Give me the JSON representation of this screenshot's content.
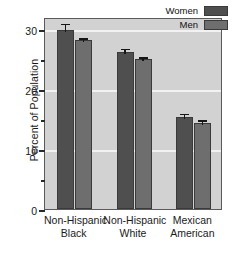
{
  "chart_data": {
    "type": "bar",
    "title": "",
    "xlabel": "",
    "ylabel": "Percent of Population",
    "ylim": [
      0,
      32
    ],
    "yticks": [
      0,
      10,
      20,
      30
    ],
    "yticks_minor": [
      5,
      15,
      25
    ],
    "ytick_labels": [
      "0",
      "10",
      "20",
      "30"
    ],
    "grid": true,
    "grid_axis": "y",
    "legend_position": "top-right",
    "categories": [
      "Non-Hispanic Black",
      "Non-Hispanic White",
      "Mexican American"
    ],
    "category_lines": [
      [
        "Non-Hispanic",
        "Black"
      ],
      [
        "Non-Hispanic",
        "White"
      ],
      [
        "Mexican",
        "American"
      ]
    ],
    "series": [
      {
        "name": "Women",
        "color": "#4f4f4f",
        "values": [
          29.9,
          26.2,
          15.3
        ],
        "errors": [
          1.2,
          0.7,
          0.8
        ]
      },
      {
        "name": "Men",
        "color": "#6e6e6e",
        "values": [
          28.1,
          25.0,
          14.3
        ],
        "errors": [
          0.6,
          0.5,
          0.7
        ]
      }
    ]
  },
  "legend": {
    "items": [
      {
        "label": "Women"
      },
      {
        "label": "Men"
      }
    ]
  },
  "axes": {
    "y_title": "Percent of Population"
  }
}
